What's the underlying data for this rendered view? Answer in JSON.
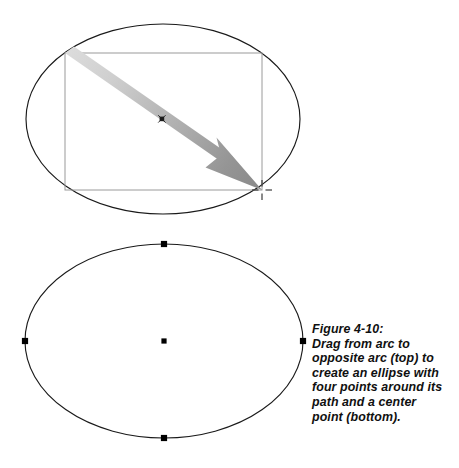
{
  "figure": {
    "caption": {
      "label": "Figure 4-10:",
      "lines": [
        "Drag from arc to",
        "opposite arc (top) to",
        "create an ellipse with",
        "four points around its",
        "path and a center",
        "point (bottom)."
      ]
    },
    "colors": {
      "outline": "#1a1a1a",
      "rect_guide": "#9a9a9a",
      "arrow_start": "#d4d4d4",
      "arrow_end": "#8c8c8c",
      "point_fill": "#000000",
      "caption_text": "#101010",
      "background": "#ffffff"
    },
    "top_diagram": {
      "name": "drag-to-create-ellipse",
      "ellipse": {
        "cx": 163,
        "cy": 119,
        "rx": 137,
        "ry": 95
      },
      "bounding_rect": {
        "x": 65,
        "y": 53,
        "width": 197,
        "height": 137
      },
      "drag_arrow": {
        "from_x": 65,
        "from_y": 53,
        "to_x": 262,
        "to_y": 190
      },
      "center_mark": {
        "x": 162,
        "y": 119,
        "glyph": "x"
      },
      "cursor_crosshair": {
        "x": 262,
        "y": 190
      }
    },
    "bottom_diagram": {
      "name": "finished-ellipse-with-points",
      "ellipse": {
        "cx": 164,
        "cy": 341,
        "rx": 139,
        "ry": 97
      },
      "points": [
        {
          "name": "top-point",
          "x": 164,
          "y": 244
        },
        {
          "name": "right-point",
          "x": 303,
          "y": 341
        },
        {
          "name": "bottom-point",
          "x": 164,
          "y": 438
        },
        {
          "name": "left-point",
          "x": 25,
          "y": 341
        },
        {
          "name": "center-point",
          "x": 164,
          "y": 341
        }
      ]
    }
  }
}
